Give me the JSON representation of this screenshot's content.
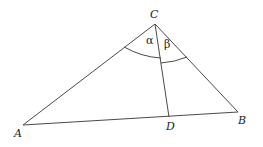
{
  "diagram": {
    "type": "triangle-with-cevian",
    "line_color": "#4a4a4a",
    "label_color": "#222222",
    "points": {
      "A": {
        "label": "A",
        "x": 23,
        "y": 125
      },
      "B": {
        "label": "B",
        "x": 238,
        "y": 112
      },
      "C": {
        "label": "C",
        "x": 155,
        "y": 24
      },
      "D": {
        "label": "D",
        "x": 169,
        "y": 117
      }
    },
    "segments": [
      "AB",
      "AC",
      "BC",
      "CD"
    ],
    "angles": {
      "alpha": {
        "symbol": "α",
        "vertex": "C",
        "between": [
          "CA",
          "CD"
        ]
      },
      "beta": {
        "symbol": "β",
        "vertex": "C",
        "between": [
          "CD",
          "CB"
        ]
      }
    }
  }
}
